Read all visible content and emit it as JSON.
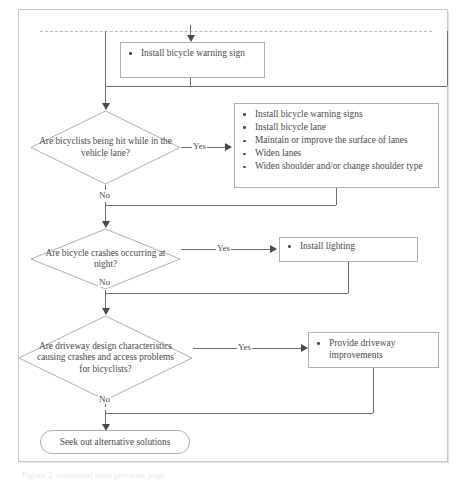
{
  "document": {
    "type": "flowchart",
    "topic": "Bicycle crash countermeasure decision flowchart",
    "page_break_marker": "dashed-line",
    "caption": "Figure 2. continued from previous page"
  },
  "flow": {
    "action_top": {
      "name": "install-bicycle-warning-sign",
      "items": [
        "Install bicycle warning sign"
      ]
    },
    "decision_1": {
      "name": "bicyclists-hit-in-vehicle-lane",
      "text": "Are bicyclists being hit while in the vehicle lane?",
      "yes_label": "Yes",
      "no_label": "No"
    },
    "action_1": {
      "name": "vehicle-lane-countermeasures",
      "items": [
        "Install bicycle warning signs",
        "Install bicycle lane",
        "Maintain or improve the surface of lanes",
        "Widen lanes",
        "Widen shoulder and/or change shoulder type"
      ]
    },
    "decision_2": {
      "name": "crashes-occurring-at-night",
      "text": "Are bicycle crashes occurring at night?",
      "yes_label": "Yes",
      "no_label": "No"
    },
    "action_2": {
      "name": "install-lighting",
      "items": [
        "Install lighting"
      ]
    },
    "decision_3": {
      "name": "driveway-design-problems",
      "text": "Are driveway design characteristics causing crashes and access problems for bicyclists?",
      "yes_label": "Yes",
      "no_label": "No"
    },
    "action_3": {
      "name": "provide-driveway-improvements",
      "items": [
        "Provide driveway improvements"
      ]
    },
    "terminal": {
      "name": "seek-alternative-solutions",
      "text": "Seek out alternative solutions"
    }
  },
  "colors": {
    "line": "#6f6f6f",
    "box_border": "#b0b0b0",
    "text": "#4b4b4b",
    "frame": "#c9c9c9",
    "page_background": "#ffffff"
  }
}
